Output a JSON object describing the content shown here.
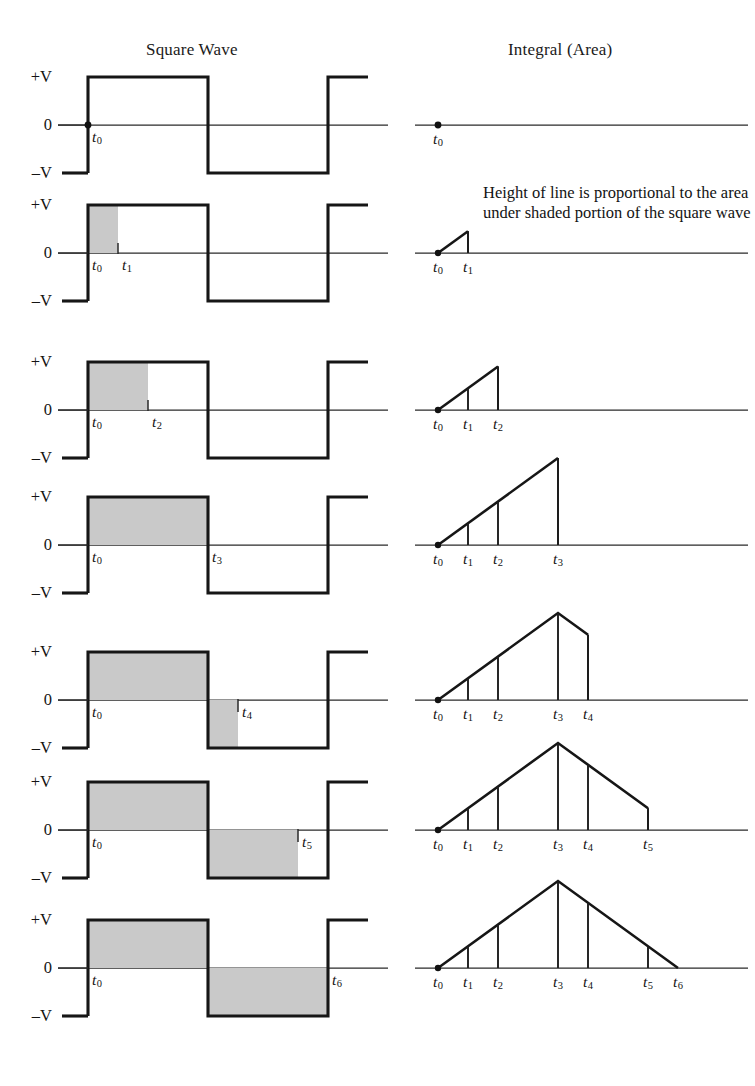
{
  "figure": {
    "columns": {
      "left_title": "Square Wave",
      "right_title": "Integral (Area)"
    },
    "caption": "Height of line is proportional to the area under shaded portion of the square wave",
    "axis_labels": {
      "positive": "+V",
      "zero": "0",
      "negative": "–V"
    },
    "time_labels": {
      "t0": "t",
      "t1": "t",
      "t2": "t",
      "t3": "t",
      "t4": "t",
      "t5": "t",
      "t6": "t"
    },
    "subscripts": [
      "0",
      "1",
      "2",
      "3",
      "4",
      "5",
      "6"
    ],
    "colors": {
      "ink": "#161616",
      "axis": "#2a2a2a",
      "shading": "#c9c9c9",
      "background": "#ffffff"
    },
    "rows": [
      {
        "id": "row-0",
        "shade_to": "t0",
        "integral_to": "t0",
        "markers": [
          "t0"
        ]
      },
      {
        "id": "row-1",
        "shade_to": "t1",
        "integral_to": "t1",
        "markers": [
          "t0",
          "t1"
        ]
      },
      {
        "id": "row-2",
        "shade_to": "t2",
        "integral_to": "t2",
        "markers": [
          "t0",
          "t1",
          "t2"
        ]
      },
      {
        "id": "row-3",
        "shade_to": "t3",
        "integral_to": "t3",
        "markers": [
          "t0",
          "t1",
          "t2",
          "t3"
        ]
      },
      {
        "id": "row-4",
        "shade_to": "t4",
        "integral_to": "t4",
        "markers": [
          "t0",
          "t1",
          "t2",
          "t3",
          "t4"
        ]
      },
      {
        "id": "row-5",
        "shade_to": "t5",
        "integral_to": "t5",
        "markers": [
          "t0",
          "t1",
          "t2",
          "t3",
          "t4",
          "t5"
        ]
      },
      {
        "id": "row-6",
        "shade_to": "t6",
        "integral_to": "t6",
        "markers": [
          "t0",
          "t1",
          "t2",
          "t3",
          "t4",
          "t5",
          "t6"
        ]
      }
    ]
  },
  "chart_data": {
    "type": "line",
    "xlabel": "time",
    "ylabel": "voltage / accumulated area",
    "left_panel": {
      "type": "line",
      "name": "Square Wave",
      "ylim": [
        -1,
        1
      ],
      "ytick_values": [
        1,
        0,
        -1
      ],
      "ytick_labels": [
        "+V",
        "0",
        "–V"
      ],
      "x": [
        0,
        0,
        3,
        3,
        6,
        6,
        7
      ],
      "y": [
        -1,
        1,
        1,
        -1,
        -1,
        1,
        1
      ],
      "time_marks": {
        "t0": 0,
        "t1": 0.75,
        "t2": 1.5,
        "t3": 3,
        "t4": 3.75,
        "t5": 5.25,
        "t6": 6
      },
      "shaded_ranges_by_row": [
        [],
        [
          [
            0,
            0.75,
            "positive"
          ]
        ],
        [
          [
            0,
            1.5,
            "positive"
          ]
        ],
        [
          [
            0,
            3,
            "positive"
          ]
        ],
        [
          [
            0,
            3,
            "positive"
          ],
          [
            3,
            3.75,
            "negative"
          ]
        ],
        [
          [
            0,
            3,
            "positive"
          ],
          [
            3,
            5.25,
            "negative"
          ]
        ],
        [
          [
            0,
            3,
            "positive"
          ],
          [
            3,
            6,
            "negative"
          ]
        ]
      ]
    },
    "right_panel": {
      "type": "line",
      "name": "Integral (Area)",
      "ylim": [
        0,
        3
      ],
      "x_breakpoints": {
        "t0": 0,
        "t1": 0.75,
        "t2": 1.5,
        "t3": 3,
        "t4": 3.75,
        "t5": 5.25,
        "t6": 6
      },
      "integral_values": {
        "t0": 0,
        "t1": 0.75,
        "t2": 1.5,
        "t3": 3,
        "t4": 2.25,
        "t5": 0.75,
        "t6": 0
      },
      "series_by_row": [
        {
          "row": 0,
          "x": [
            0
          ],
          "y": [
            0
          ]
        },
        {
          "row": 1,
          "x": [
            0,
            0.75
          ],
          "y": [
            0,
            0.75
          ]
        },
        {
          "row": 2,
          "x": [
            0,
            1.5
          ],
          "y": [
            0,
            1.5
          ]
        },
        {
          "row": 3,
          "x": [
            0,
            3
          ],
          "y": [
            0,
            3
          ]
        },
        {
          "row": 4,
          "x": [
            0,
            3,
            3.75
          ],
          "y": [
            0,
            3,
            2.25
          ]
        },
        {
          "row": 5,
          "x": [
            0,
            3,
            5.25
          ],
          "y": [
            0,
            3,
            0.75
          ]
        },
        {
          "row": 6,
          "x": [
            0,
            3,
            6
          ],
          "y": [
            0,
            3,
            0
          ]
        }
      ],
      "dropline_positions_by_row": [
        [],
        [
          "t1"
        ],
        [
          "t1",
          "t2"
        ],
        [
          "t1",
          "t2",
          "t3"
        ],
        [
          "t1",
          "t2",
          "t3",
          "t4"
        ],
        [
          "t1",
          "t2",
          "t3",
          "t4",
          "t5"
        ],
        [
          "t1",
          "t2",
          "t3",
          "t4",
          "t5"
        ]
      ]
    },
    "grid": false,
    "legend": "none",
    "annotations": [
      {
        "text": "Height of line is proportional to the area under shaded portion of the square wave",
        "attached_to_row": 1,
        "panel": "right"
      }
    ]
  }
}
